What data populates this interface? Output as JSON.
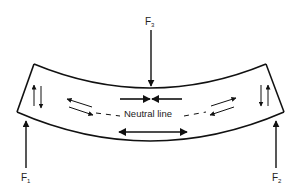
{
  "diagram": {
    "labels": {
      "f1": {
        "base": "F",
        "sub": "1"
      },
      "f2": {
        "base": "F",
        "sub": "2"
      },
      "f3": {
        "base": "F",
        "sub": "3"
      },
      "neutral_line": "Neutral line"
    },
    "colors": {
      "stroke": "#111111",
      "background": "#ffffff"
    }
  }
}
